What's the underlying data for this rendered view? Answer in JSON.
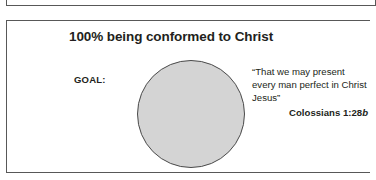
{
  "figure": {
    "heading": "100% being conformed to Christ",
    "goal_label": "GOAL:",
    "circle": {
      "name": "goal-circle",
      "fill_color": "#d4d4d4",
      "stroke_color": "#4a4a4a"
    },
    "quote": {
      "text": "“That we may present every man perfect in Christ Jesus”",
      "citation_book": "Colossians 1:28",
      "citation_suffix": "b"
    },
    "colors": {
      "text": "#231f20",
      "border": "#585858",
      "circle_fill": "#d4d4d4",
      "background": "#ffffff"
    }
  },
  "top_partial": {
    "ghost_shape_a": "circle-shape",
    "ghost_shape_b": "circle-shape"
  }
}
